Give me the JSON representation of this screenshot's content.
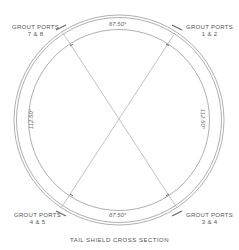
{
  "diagram": {
    "title": "TAIL SHIELD CROSS SECTION",
    "line_color": "#9a9a9a",
    "ports": [
      {
        "id": "ports-7-8",
        "line1": "GROUT PORTS",
        "line2": "7 & 8"
      },
      {
        "id": "ports-1-2",
        "line1": "GROUT PORTS",
        "line2": "1 & 2"
      },
      {
        "id": "ports-4-5",
        "line1": "GROUT PORTS",
        "line2": "4 & 5"
      },
      {
        "id": "ports-3-4",
        "line1": "GROUT PORTS",
        "line2": "3 & 4"
      }
    ],
    "dimensions": {
      "top": "67.50°",
      "bottom": "67.50°",
      "left": "112.50°",
      "right": "112.50°"
    }
  }
}
